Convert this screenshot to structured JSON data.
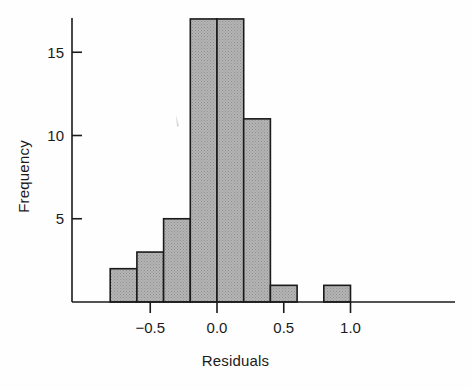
{
  "figure": {
    "background": "#ffffff",
    "ink": "#1a1a1a"
  },
  "chart_data": {
    "type": "bar",
    "chart_subtype": "histogram",
    "title": "",
    "xlabel": "Residuals",
    "ylabel": "Frequency",
    "xlim": [
      -0.85,
      1.15
    ],
    "ylim": [
      0,
      18
    ],
    "grid": false,
    "legend": null,
    "bin_width": 0.2,
    "bin_edges": [
      -0.8,
      -0.6,
      -0.4,
      -0.2,
      0.0,
      0.2,
      0.4,
      0.6,
      0.8,
      1.0
    ],
    "categories": [
      "-0.8 to -0.6",
      "-0.6 to -0.4",
      "-0.4 to -0.2",
      "-0.2 to 0.0",
      "0.0 to 0.2",
      "0.2 to 0.4",
      "0.4 to 0.6",
      "0.6 to 0.8",
      "0.8 to 1.0"
    ],
    "values": [
      2,
      3,
      5,
      17,
      17,
      11,
      1,
      0,
      1
    ],
    "bar_fill": "#a8a8a8",
    "bar_edge": "#1a1a1a",
    "xticks": [
      -0.5,
      0.0,
      0.5,
      1.0
    ],
    "xticklabels": [
      "−0.5",
      "0.0",
      "0.5",
      "1.0"
    ],
    "yticks": [
      5,
      10,
      15
    ],
    "yticklabels": [
      "5",
      "10",
      "15"
    ],
    "total_count": 57
  },
  "axes": {
    "x_axis_label": "Residuals",
    "y_axis_label": "Frequency"
  }
}
